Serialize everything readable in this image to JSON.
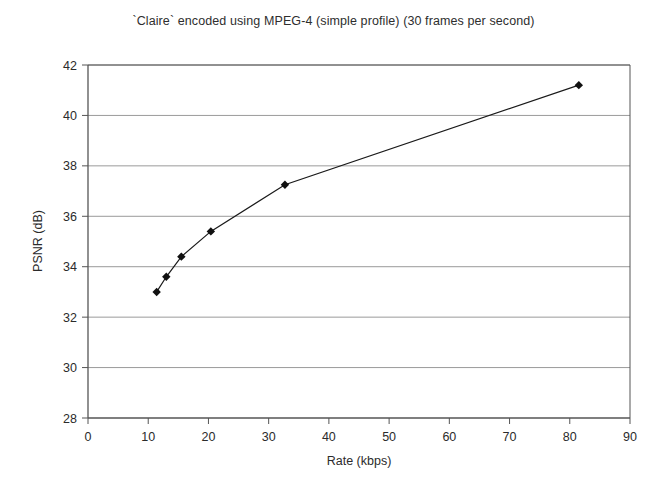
{
  "chart_data": {
    "type": "line",
    "title": "`Claire` encoded using MPEG-4 (simple profile) (30 frames per second)",
    "xlabel": "Rate (kbps)",
    "ylabel": "PSNR (dB)",
    "xlim": [
      0,
      90
    ],
    "ylim": [
      28,
      42
    ],
    "xticks": [
      0,
      10,
      20,
      30,
      40,
      50,
      60,
      70,
      80,
      90
    ],
    "yticks": [
      28,
      30,
      32,
      34,
      36,
      38,
      40,
      42
    ],
    "xtick_labels": [
      "0",
      "10",
      "20",
      "30",
      "40",
      "50",
      "60",
      "70",
      "80",
      "90"
    ],
    "ytick_labels": [
      "28",
      "30",
      "32",
      "34",
      "36",
      "38",
      "40",
      "42"
    ],
    "grid": "horizontal",
    "legend": "none",
    "marker": "diamond",
    "series": [
      {
        "name": "MPEG-4 simple profile",
        "color": "#1a1a1a",
        "points": [
          {
            "x": 11.4,
            "y": 33.0
          },
          {
            "x": 13.0,
            "y": 33.6
          },
          {
            "x": 15.5,
            "y": 34.4
          },
          {
            "x": 20.4,
            "y": 35.4
          },
          {
            "x": 32.7,
            "y": 37.25
          },
          {
            "x": 81.5,
            "y": 41.2
          }
        ]
      }
    ]
  },
  "style": {
    "background": "#ffffff",
    "frame_color": "#555555",
    "grid_color": "#9a9a9a",
    "line_color": "#333333",
    "marker_color": "#111111",
    "text_color": "#2b2b2b"
  }
}
